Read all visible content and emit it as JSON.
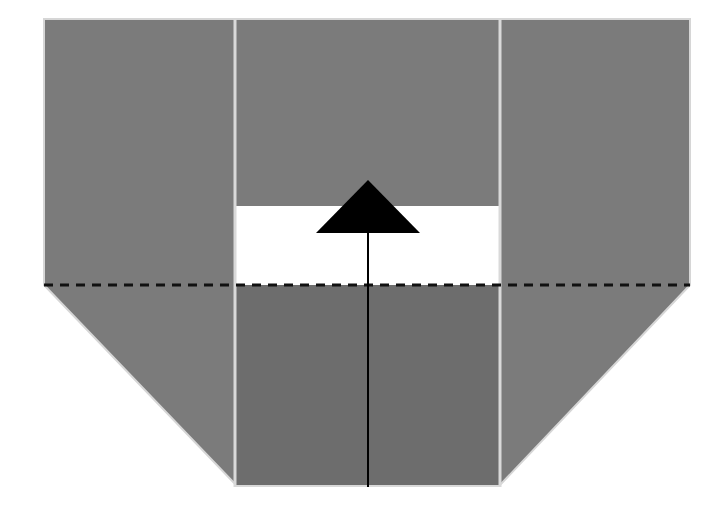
{
  "diagram": {
    "type": "origami-fold-step",
    "colors": {
      "paper": "#7b7b7b",
      "paper_lower_center": "#6d6d6d",
      "crease": "#d9d9d9",
      "window": "#ffffff",
      "arrow": "#000000",
      "fold_line": "#111111"
    },
    "fold_line": {
      "style": "dashed",
      "y": 285,
      "x1": 44,
      "x2": 690
    },
    "arrow": {
      "direction": "up",
      "meaning": "fold up along dashed line"
    }
  }
}
